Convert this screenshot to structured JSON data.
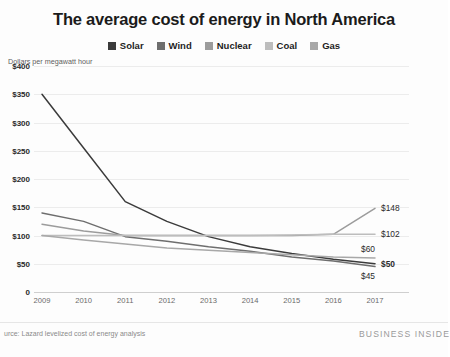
{
  "header": {
    "title": "The average cost of energy in North America"
  },
  "legend": {
    "position": "top-center",
    "items": [
      {
        "label": "Solar",
        "color": "#3b3b3b"
      },
      {
        "label": "Wind",
        "color": "#6e6e6e"
      },
      {
        "label": "Nuclear",
        "color": "#9c9c9c"
      },
      {
        "label": "Coal",
        "color": "#bdbdbd"
      },
      {
        "label": "Gas",
        "color": "#a8a8a8"
      }
    ]
  },
  "axis_caption": "Dollars per megawatt hour",
  "footer": {
    "source": "urce: Lazard levelized cost of energy analysis",
    "brand": "BUSINESS INSIDE"
  },
  "end_labels": [
    {
      "text": "$148",
      "value": 148,
      "bold": false
    },
    {
      "text": "$102",
      "value": 102,
      "bold": false
    },
    {
      "text": "$60",
      "value": 60,
      "bold": false
    },
    {
      "text": "$50",
      "value": 50,
      "bold": true
    },
    {
      "text": "$45",
      "value": 45,
      "bold": false
    }
  ],
  "chart_data": {
    "type": "line",
    "title": "The average cost of energy in North America",
    "xlabel": "",
    "ylabel": "Dollars per megawatt hour",
    "ylim": [
      0,
      400
    ],
    "yticks": [
      0,
      50,
      100,
      150,
      200,
      250,
      300,
      350,
      400
    ],
    "ytick_labels": [
      "0",
      "$50",
      "$100",
      "$150",
      "$200",
      "$250",
      "$300",
      "$350",
      "$400"
    ],
    "grid": true,
    "legend_position": "top-center",
    "x": [
      2009,
      2010,
      2011,
      2012,
      2013,
      2014,
      2015,
      2016,
      2017
    ],
    "categories": [
      "2009",
      "2010",
      "2011",
      "2012",
      "2013",
      "2014",
      "2015",
      "2016",
      "2017"
    ],
    "series": [
      {
        "name": "Solar",
        "color": "#3b3b3b",
        "values": [
          350,
          255,
          160,
          125,
          98,
          80,
          68,
          58,
          50
        ],
        "end_label": "$50"
      },
      {
        "name": "Wind",
        "color": "#6e6e6e",
        "values": [
          140,
          125,
          98,
          90,
          80,
          72,
          62,
          55,
          45
        ],
        "end_label": "$45"
      },
      {
        "name": "Nuclear",
        "color": "#9c9c9c",
        "values": [
          120,
          108,
          100,
          100,
          100,
          100,
          100,
          102,
          148
        ],
        "end_label": "$148"
      },
      {
        "name": "Coal",
        "color": "#bdbdbd",
        "values": [
          100,
          100,
          100,
          100,
          100,
          100,
          101,
          102,
          102
        ],
        "end_label": "$102"
      },
      {
        "name": "Gas",
        "color": "#a8a8a8",
        "values": [
          100,
          92,
          85,
          78,
          74,
          70,
          66,
          62,
          60
        ],
        "end_label": "$60"
      }
    ]
  }
}
